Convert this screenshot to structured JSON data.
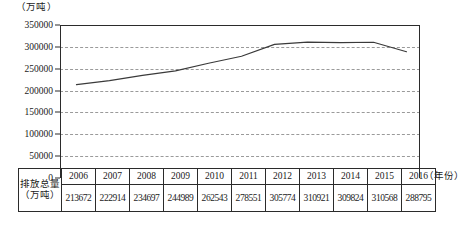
{
  "chart_data": {
    "type": "line",
    "title": "",
    "xlabel": "（年份）",
    "ylabel": "（万吨）",
    "categories": [
      "2006",
      "2007",
      "2008",
      "2009",
      "2010",
      "2011",
      "2012",
      "2013",
      "2014",
      "2015",
      "2016"
    ],
    "values": [
      213672,
      222914,
      234697,
      244989,
      262543,
      278551,
      305774,
      310921,
      309824,
      310568,
      288795
    ],
    "series": [
      {
        "name": "排放总量（万吨）",
        "values": [
          213672,
          222914,
          234697,
          244989,
          262543,
          278551,
          305774,
          310921,
          309824,
          310568,
          288795
        ]
      }
    ],
    "ylim": [
      0,
      350000
    ],
    "ytick_labels": [
      "350000",
      "300000",
      "250000",
      "200000",
      "150000",
      "100000",
      "50000",
      "0"
    ],
    "ytick_values": [
      350000,
      300000,
      250000,
      200000,
      150000,
      100000,
      50000,
      0
    ],
    "ytick_step": 50000,
    "grid": true,
    "grid_style": "dashed",
    "grid_color": "#9a9a9a",
    "line_color": "#3a3a3a",
    "axis_color": "#2b2b2b",
    "legend": false,
    "legend_position": "none"
  },
  "axis": {
    "y_unit_label": "（万吨）",
    "x_unit_label": "（年份）"
  },
  "table": {
    "row_label_line1": "排放总量",
    "row_label_line2": "（万吨）",
    "years": [
      "2006",
      "2007",
      "2008",
      "2009",
      "2010",
      "2011",
      "2012",
      "2013",
      "2014",
      "2015",
      "2016"
    ],
    "values": [
      "213672",
      "222914",
      "234697",
      "244989",
      "262543",
      "278551",
      "305774",
      "310921",
      "309824",
      "310568",
      "288795"
    ]
  }
}
